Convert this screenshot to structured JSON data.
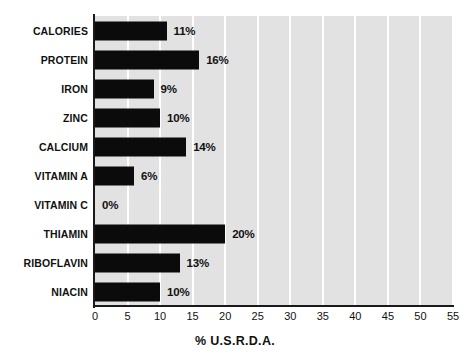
{
  "chart_data": {
    "type": "bar",
    "orientation": "horizontal",
    "title": "",
    "xlabel": "% U.S.R.D.A.",
    "ylabel": "",
    "categories": [
      "CALORIES",
      "PROTEIN",
      "IRON",
      "ZINC",
      "CALCIUM",
      "VITAMIN A",
      "VITAMIN C",
      "THIAMIN",
      "RIBOFLAVIN",
      "NIACIN"
    ],
    "values": [
      11,
      16,
      9,
      10,
      14,
      6,
      0,
      20,
      13,
      10
    ],
    "value_labels": [
      "11%",
      "16%",
      "9%",
      "10%",
      "14%",
      "6%",
      "0%",
      "20%",
      "13%",
      "10%"
    ],
    "xlim": [
      0,
      55
    ],
    "xticks": [
      0,
      5,
      10,
      15,
      20,
      25,
      30,
      35,
      40,
      45,
      50,
      55
    ],
    "xtick_labels": [
      "0",
      "5",
      "10",
      "15",
      "20",
      "25",
      "30",
      "35",
      "40",
      "45",
      "50",
      "55"
    ],
    "grid": "vertical-white-gridlines",
    "legend": "none",
    "colors": {
      "bar": "#0b0b0b",
      "plot_background": "#e2e2e2",
      "gridline": "#ffffff",
      "axis": "#1a1a1a",
      "text": "#111111",
      "page_background": "#ffffff"
    }
  }
}
